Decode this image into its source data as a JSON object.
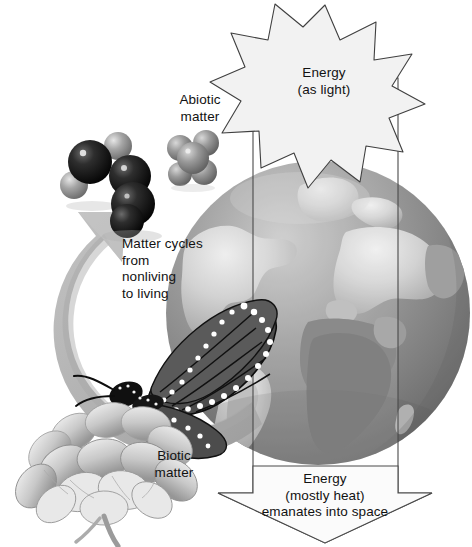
{
  "diagram": {
    "canvas": {
      "width": 472,
      "height": 547,
      "background": "#ffffff"
    },
    "labels": {
      "energy_light": "Energy\n(as light)",
      "abiotic_matter": "Abiotic\nmatter",
      "matter_cycles": "Matter cycles\nfrom\nnonliving\nto living",
      "biotic_matter": "Biotic\nmatter",
      "energy_heat": "Energy\n(mostly heat)\nemanates into space"
    },
    "elements": {
      "sunburst": {
        "name": "energy-as-light-starburst",
        "points": 11,
        "fill": "#f2f2f2",
        "stroke": "#3f3f3f",
        "center_x": 325,
        "center_y": 83,
        "outer_radius": 78,
        "inner_radius": 50
      },
      "energy_arrow": {
        "name": "energy-flow-down-arrow",
        "fill": "#fafafa",
        "stroke": "#4a4a4a",
        "shaft_left": 253,
        "shaft_right": 398,
        "shaft_top": 78,
        "head_top": 493,
        "head_left": 218,
        "head_right": 432,
        "tip_x": 325,
        "tip_y": 543
      },
      "globe": {
        "name": "earth-globe",
        "center_x": 318,
        "center_y": 313,
        "radius": 152,
        "ocean_color": "#8d8d8d",
        "land_color": "#d4d4d4"
      },
      "matter_cycle_arrow": {
        "name": "matter-cycle-circular-arrow",
        "color": "#b3b3b3",
        "shadow_color": "#9a9a9a",
        "center_x": 178,
        "center_y": 322,
        "radius": 124,
        "thickness": 34
      },
      "molecules": [
        {
          "name": "water-molecule",
          "x": 86,
          "y": 160,
          "atom_dark": "#1f1f1f",
          "atom_light": "#a8a8a8"
        },
        {
          "name": "carbon-dioxide-molecule",
          "x": 128,
          "y": 196,
          "atom_dark": "#141414",
          "atom_light": "#2a2a2a"
        },
        {
          "name": "methane-molecule",
          "x": 193,
          "y": 157,
          "atom_dark": "#8b8b8b",
          "atom_light": "#b4b4b4"
        }
      ],
      "butterfly": {
        "name": "monarch-butterfly",
        "x": 88,
        "y": 370,
        "wing_dark": "#4a4a4a",
        "wing_vein": "#111111",
        "spot_color": "#ffffff"
      },
      "flower": {
        "name": "flower-cluster",
        "x": 70,
        "y": 460,
        "petal_light": "#e3e3e3",
        "petal_mid": "#bdbdbd",
        "petal_shadow": "#8f8f8f"
      }
    },
    "colors": {
      "text": "#121212",
      "outline": "#444444",
      "arrow_gray": "#b3b3b3",
      "globe_ocean": "#8d8d8d",
      "globe_land": "#d4d4d4"
    }
  }
}
